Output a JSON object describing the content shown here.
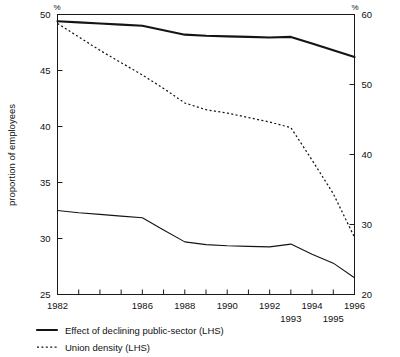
{
  "chart_data": {
    "type": "line",
    "title": "",
    "xlabel": "",
    "ylabel": "proportion of employees",
    "y_axis_unit_left": "%",
    "y_axis_unit_right": "%",
    "ylim": [
      25,
      50
    ],
    "y_ticks_left": [
      25,
      30,
      35,
      40,
      45,
      50
    ],
    "ylim_right": [
      20,
      60
    ],
    "y_ticks_right": [
      20,
      30,
      40,
      50,
      60
    ],
    "xlim": [
      1982,
      1996
    ],
    "x_ticks": [
      1982,
      1983,
      1984,
      1985,
      1986,
      1987,
      1988,
      1989,
      1990,
      1991,
      1992,
      1993,
      1994,
      1995,
      1996
    ],
    "x_tick_labels_upper": [
      "1982",
      "1986",
      "1988",
      "1990",
      "1992",
      "1994",
      "1996"
    ],
    "x_tick_labels_upper_years": [
      1982,
      1986,
      1988,
      1990,
      1992,
      1994,
      1996
    ],
    "x_tick_labels_lower": [
      "1993",
      "1995"
    ],
    "x_tick_labels_lower_years": [
      1993,
      1995
    ],
    "grid": false,
    "legend_position": "bottom-left",
    "x": [
      1982,
      1983,
      1984,
      1985,
      1986,
      1987,
      1988,
      1989,
      1990,
      1991,
      1992,
      1993,
      1994,
      1995,
      1996
    ],
    "series": [
      {
        "name": "Effect of declining public-sector (LHS)",
        "style": "solid-thick",
        "values": [
          49.4,
          49.3,
          49.2,
          49.1,
          49.0,
          48.6,
          48.2,
          48.1,
          48.05,
          48.0,
          47.95,
          48.0,
          47.4,
          46.8,
          46.2
        ]
      },
      {
        "name": "Union density (LHS)",
        "style": "dashed",
        "values": [
          49.2,
          48.0,
          46.8,
          45.7,
          44.6,
          43.4,
          42.1,
          41.5,
          41.2,
          40.8,
          40.4,
          39.9,
          37.0,
          34.0,
          30.1
        ]
      },
      {
        "name": "unlabelled-lower-series",
        "style": "solid-thin",
        "values": [
          32.5,
          32.3,
          32.15,
          32.0,
          31.85,
          30.75,
          29.7,
          29.45,
          29.35,
          29.3,
          29.25,
          29.5,
          28.6,
          27.8,
          26.5
        ]
      }
    ],
    "legend": [
      {
        "label": "Effect of declining public-sector (LHS)",
        "style": "solid-thick"
      },
      {
        "label": "Union density (LHS)",
        "style": "dashed"
      }
    ]
  }
}
